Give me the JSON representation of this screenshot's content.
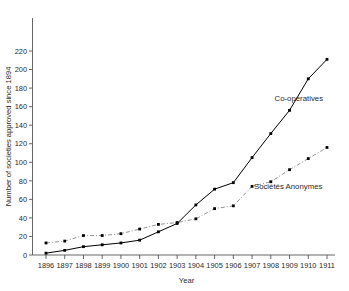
{
  "chart_data": {
    "type": "line",
    "title": "",
    "xlabel": "Year",
    "ylabel": "Number of societies approved since 1894",
    "x": [
      1896,
      1897,
      1898,
      1899,
      1900,
      1901,
      1902,
      1903,
      1904,
      1905,
      1906,
      1907,
      1908,
      1909,
      1910,
      1911
    ],
    "xticklabels": [
      "1896",
      "1897",
      "1898",
      "1899",
      "1900",
      "1901",
      "1902",
      "1903",
      "1904",
      "1905",
      "1906",
      "1907",
      "1908",
      "1909",
      "1910",
      "1911"
    ],
    "yticklabels": [
      "0",
      "20",
      "40",
      "60",
      "80",
      "100",
      "120",
      "140",
      "160",
      "180",
      "200",
      "220"
    ],
    "yticks": [
      0,
      20,
      40,
      60,
      80,
      100,
      120,
      140,
      160,
      180,
      200,
      220
    ],
    "ylim": [
      0,
      240
    ],
    "xlim": [
      1895.5,
      1911.5
    ],
    "grid": false,
    "legend_position": "inline-annotations",
    "series": [
      {
        "name": "Co-operatives",
        "style": "solid",
        "color": "#000000",
        "label_x": 1908.2,
        "label_y": 166,
        "values": [
          2,
          5,
          9,
          11,
          13,
          16,
          25,
          34,
          54,
          71,
          78,
          105,
          131,
          156,
          190,
          211
        ]
      },
      {
        "name": "Sociétés Anonymes",
        "style": "dash-dot",
        "color": "#888888",
        "label_x": 1907.1,
        "label_y": 71,
        "values": [
          13,
          15,
          21,
          21,
          23,
          28,
          33,
          35,
          39,
          50,
          53,
          74,
          79,
          92,
          104,
          116
        ]
      }
    ],
    "annotations": [
      {
        "name": "co-operatives-leader",
        "text": "Co-operatives"
      },
      {
        "name": "societes-anonymes-leader",
        "text": "Sociétés Anonymes"
      }
    ]
  }
}
